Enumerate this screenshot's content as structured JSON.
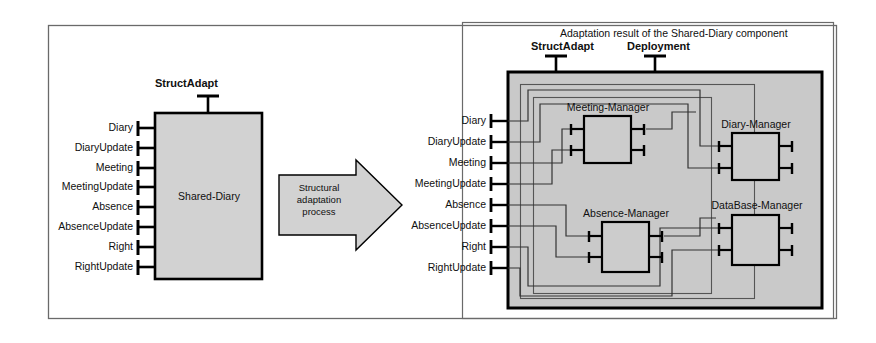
{
  "diagram": {
    "arrow_label_line1": "Structural",
    "arrow_label_line2": "adaptation",
    "arrow_label_line3": "process",
    "colors": {
      "component_fill": "#d0d0d0",
      "panel_fill": "#c8c8c8",
      "stroke": "#000000",
      "frame_stroke": "#555555",
      "background": "#ffffff"
    }
  },
  "left": {
    "component_name": "Shared-Diary",
    "top_port": "StructAdapt",
    "ports": [
      {
        "label": "Diary"
      },
      {
        "label": "DiaryUpdate"
      },
      {
        "label": "Meeting"
      },
      {
        "label": "MeetingUpdate"
      },
      {
        "label": "Absence"
      },
      {
        "label": "AbsenceUpdate"
      },
      {
        "label": "Right"
      },
      {
        "label": "RightUpdate"
      }
    ]
  },
  "right": {
    "panel_title": "Adaptation result of the Shared-Diary component",
    "top_ports": [
      {
        "label": "StructAdapt"
      },
      {
        "label": "Deployment"
      }
    ],
    "ports": [
      {
        "label": "Diary"
      },
      {
        "label": "DiaryUpdate"
      },
      {
        "label": "Meeting"
      },
      {
        "label": "MeetingUpdate"
      },
      {
        "label": "Absence"
      },
      {
        "label": "AbsenceUpdate"
      },
      {
        "label": "Right"
      },
      {
        "label": "RightUpdate"
      }
    ],
    "subcomponents": [
      {
        "name": "Meeting-Manager"
      },
      {
        "name": "Diary-Manager"
      },
      {
        "name": "Absence-Manager"
      },
      {
        "name": "DataBase-Manager"
      }
    ]
  }
}
